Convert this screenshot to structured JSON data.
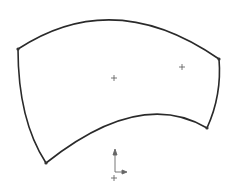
{
  "sketch": {
    "stroke_color": "#2a2a2a",
    "point_color": "#333333",
    "marker_color": "#555555",
    "vertices": [
      {
        "x": 18,
        "y": 49
      },
      {
        "x": 219,
        "y": 59
      },
      {
        "x": 207,
        "y": 128
      },
      {
        "x": 46,
        "y": 163
      }
    ],
    "centers": [
      {
        "x": 114,
        "y": 78
      },
      {
        "x": 182,
        "y": 67
      }
    ],
    "origin": {
      "x": 114,
      "y": 170
    }
  }
}
